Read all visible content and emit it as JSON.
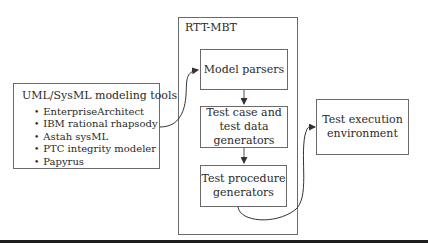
{
  "diagram": {
    "tools_box": {
      "title": "UML/SysML modeling tools",
      "items": [
        "EnterpriseArchitect",
        "IBM rational rhapsody",
        "Astah sysML",
        "PTC integrity modeler",
        "Papyrus"
      ]
    },
    "rtt_mbt": {
      "title": "RTT-MBT",
      "components": {
        "model_parsers": "Model parsers",
        "test_case_line1": "Test case and",
        "test_case_line2": "test data",
        "test_case_line3": "generators",
        "test_proc_line1": "Test procedure",
        "test_proc_line2": "generators"
      }
    },
    "test_exec": {
      "line1": "Test execution",
      "line2": "environment"
    },
    "colors": {
      "stroke": "#6a6a6a",
      "arrow": "#333333",
      "rule": "#1e1e1e"
    }
  }
}
